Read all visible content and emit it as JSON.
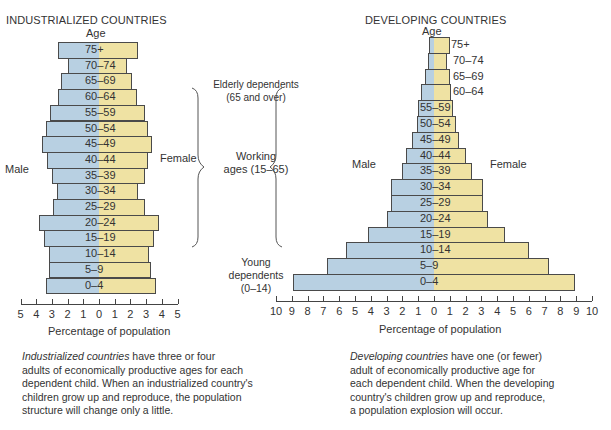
{
  "colors": {
    "male": "#b8d0e2",
    "female": "#efe2a3",
    "border": "#4a4a4a",
    "text": "#333333"
  },
  "chart_data": [
    {
      "type": "bar",
      "orientation": "horizontal-population-pyramid",
      "title": "INDUSTRIALIZED COUNTRIES",
      "ylabel": "Age",
      "xlabel": "Percentage of population",
      "xlim": [
        -5,
        5
      ],
      "x_ticks": [
        "5",
        "4",
        "3",
        "2",
        "1",
        "0",
        "1",
        "2",
        "3",
        "4",
        "5"
      ],
      "left_label": "Male",
      "right_label": "Female",
      "categories": [
        "75+",
        "70–74",
        "65–69",
        "60–64",
        "55–59",
        "50–54",
        "45–49",
        "40–44",
        "35–39",
        "30–34",
        "25–29",
        "20–24",
        "15–19",
        "10–14",
        "5–9",
        "0–4"
      ],
      "series": [
        {
          "name": "Male",
          "values": [
            2.6,
            2.0,
            2.4,
            2.6,
            3.1,
            3.4,
            3.6,
            3.3,
            3.0,
            2.7,
            2.9,
            3.8,
            3.5,
            3.2,
            3.2,
            3.4
          ]
        },
        {
          "name": "Female",
          "values": [
            2.5,
            1.8,
            2.1,
            2.4,
            2.9,
            3.1,
            3.4,
            3.1,
            2.9,
            2.5,
            2.9,
            3.8,
            3.5,
            3.2,
            3.3,
            3.6
          ]
        }
      ],
      "grid": false,
      "caption_italic": "Industrialized countries",
      "caption_rest": " have three or four adults of economically productive ages for each dependent child. When an industrialized country's children grow up and reproduce, the population structure will change only a little."
    },
    {
      "type": "bar",
      "orientation": "horizontal-population-pyramid",
      "title": "DEVELOPING COUNTRIES",
      "ylabel": "Age",
      "xlabel": "Percentage of population",
      "xlim": [
        -10,
        10
      ],
      "x_ticks": [
        "10",
        "9",
        "8",
        "7",
        "6",
        "5",
        "4",
        "3",
        "2",
        "1",
        "0",
        "1",
        "2",
        "3",
        "4",
        "5",
        "6",
        "7",
        "8",
        "9",
        "10"
      ],
      "left_label": "Male",
      "right_label": "Female",
      "categories": [
        "75+",
        "70–74",
        "65–69",
        "60–64",
        "55–59",
        "50–54",
        "45–49",
        "40–44",
        "35–39",
        "30–34",
        "25–29",
        "20–24",
        "15–19",
        "10–14",
        "5–9",
        "0–4"
      ],
      "series": [
        {
          "name": "Male",
          "values": [
            0.3,
            0.4,
            0.6,
            0.8,
            1.0,
            1.1,
            1.4,
            1.8,
            2.0,
            2.7,
            2.7,
            3.0,
            4.2,
            5.6,
            6.8,
            8.9
          ]
        },
        {
          "name": "Female",
          "values": [
            1.0,
            0.8,
            1.0,
            1.1,
            1.2,
            1.4,
            1.6,
            2.0,
            2.4,
            3.1,
            3.1,
            3.4,
            4.5,
            6.0,
            7.3,
            8.9
          ]
        }
      ],
      "grid": false,
      "caption_italic": "Developing countries",
      "caption_rest": " have one (or fewer) adult of economically productive age for each dependent child. When the developing country's children grow up and reproduce, a population explosion will occur."
    }
  ],
  "annotations": {
    "elderly_line1": "Elderly dependents",
    "elderly_line2": "(65 and over)",
    "working_line1": "Working",
    "working_line2": "ages (15–65)",
    "young_line1": "Young",
    "young_line2": "dependents",
    "young_line3": "(0–14)"
  },
  "captions": {
    "left_lines": [
      {
        "italic": "Industrialized countries",
        "rest": " have three or four"
      },
      {
        "italic": "",
        "rest": "adults of economically productive ages for each"
      },
      {
        "italic": "",
        "rest": "dependent child. When an industrialized country's"
      },
      {
        "italic": "",
        "rest": "children grow up and reproduce, the population"
      },
      {
        "italic": "",
        "rest": "structure will change only a little."
      }
    ],
    "right_lines": [
      {
        "italic": "Developing countries",
        "rest": " have one (or fewer)"
      },
      {
        "italic": "",
        "rest": "adult of economically productive age for"
      },
      {
        "italic": "",
        "rest": "each dependent child. When the developing"
      },
      {
        "italic": "",
        "rest": "country's children grow up and reproduce,"
      },
      {
        "italic": "",
        "rest": "a population explosion will occur."
      }
    ]
  }
}
